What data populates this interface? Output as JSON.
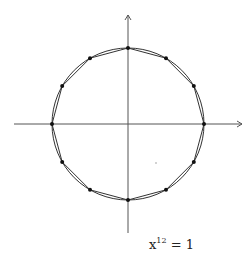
{
  "diagram": {
    "equation": {
      "base": "x",
      "exponent": "12",
      "rhs": "= 1"
    },
    "center": [
      128,
      124
    ],
    "radius": 76,
    "n": 12,
    "axes": {
      "x_from": 14,
      "x_to": 242,
      "y_from": 15,
      "y_to": 233
    },
    "colors": {
      "stroke": "#333333",
      "points": "#111111",
      "axis": "#555555"
    }
  }
}
